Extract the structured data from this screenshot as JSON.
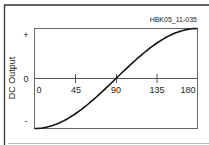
{
  "chart_data": {
    "type": "line",
    "title": "",
    "annotation": "HBK05_11-035",
    "xlabel": "",
    "ylabel": "DC Output",
    "x_ticks": [
      "0",
      "45",
      "90",
      "135",
      "180"
    ],
    "y_ticks": [
      "+",
      "0",
      "-"
    ],
    "xlim": [
      0,
      180
    ],
    "ylim": [
      -1,
      1
    ],
    "grid": false,
    "series": [
      {
        "name": "DC Output",
        "x": [
          0,
          15,
          30,
          45,
          60,
          75,
          90,
          105,
          120,
          135,
          150,
          165,
          180
        ],
        "values": [
          -1,
          -0.966,
          -0.866,
          -0.707,
          -0.5,
          -0.259,
          0,
          0.259,
          0.5,
          0.707,
          0.866,
          0.966,
          1
        ]
      }
    ]
  },
  "labels": {
    "annotation": "HBK05_11-035",
    "ylabel": "DC Output",
    "plus": "+",
    "zero": "0",
    "minus": "-",
    "x0": "0",
    "x45": "45",
    "x90": "90",
    "x135": "135",
    "x180": "180"
  }
}
